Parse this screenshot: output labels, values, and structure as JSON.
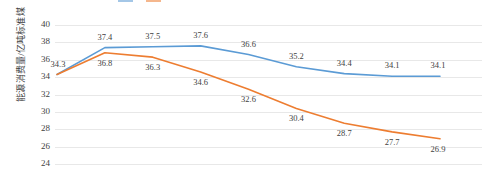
{
  "chart_data": {
    "type": "line",
    "title": "",
    "xlabel": "",
    "ylabel": "能源消费量/亿吨标准煤",
    "ylim": [
      24,
      40
    ],
    "ytick_step": 2,
    "yticks": [
      40,
      38,
      36,
      34,
      32,
      30,
      28,
      26,
      24
    ],
    "grid": true,
    "grid_color": "#e8e8e8",
    "legend_position": "top",
    "legend_visible_partial": true,
    "x": [
      1,
      2,
      3,
      4,
      5,
      6,
      7,
      8,
      9
    ],
    "categories": [
      "",
      "",
      "",
      "",
      "",
      "",
      "",
      "",
      ""
    ],
    "series": [
      {
        "name": "series-1",
        "color": "#5b9bd5",
        "values": [
          34.3,
          37.4,
          37.5,
          37.6,
          36.6,
          35.2,
          34.4,
          34.1,
          34.1
        ],
        "labels": [
          "34.3",
          "37.4",
          "37.5",
          "37.6",
          "36.6",
          "35.2",
          "34.4",
          "34.1",
          "34.1"
        ],
        "label_position": "above"
      },
      {
        "name": "series-2",
        "color": "#ed7d31",
        "values": [
          34.3,
          36.8,
          36.3,
          34.6,
          32.6,
          30.4,
          28.7,
          27.7,
          26.9
        ],
        "labels": [
          "",
          "36.8",
          "36.3",
          "34.6",
          "32.6",
          "30.4",
          "28.7",
          "27.7",
          "26.9"
        ],
        "label_position": "below"
      }
    ]
  },
  "legend": {
    "entries": [
      {
        "label": "",
        "color": "#5b9bd5"
      },
      {
        "label": "",
        "color": "#ed7d31"
      }
    ]
  }
}
